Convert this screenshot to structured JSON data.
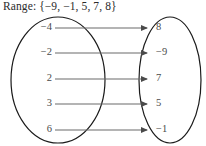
{
  "figure": {
    "title": "Range: {−9, −1, 5, 7, 8}",
    "type": "mapping-diagram",
    "line_color": "#5a5a5a",
    "oval_color": "#1a1a1a",
    "text_color": "#3a3a3a",
    "background": "#ffffff"
  },
  "domain": {
    "oval_name": "domain-oval",
    "items": [
      {
        "label": "−4"
      },
      {
        "label": "−2"
      },
      {
        "label": "2"
      },
      {
        "label": "3"
      },
      {
        "label": "6"
      }
    ]
  },
  "range": {
    "oval_name": "range-oval",
    "items": [
      {
        "label": "8"
      },
      {
        "label": "−9"
      },
      {
        "label": "7"
      },
      {
        "label": "5"
      },
      {
        "label": "−1"
      }
    ]
  },
  "mappings": [
    {
      "from": "−4",
      "to": "8"
    },
    {
      "from": "−2",
      "to": "−9"
    },
    {
      "from": "2",
      "to": "7"
    },
    {
      "from": "3",
      "to": "5"
    },
    {
      "from": "6",
      "to": "−1"
    }
  ]
}
